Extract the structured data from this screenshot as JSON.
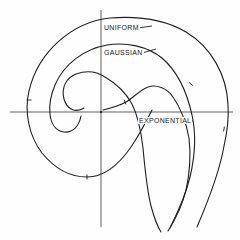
{
  "figure": {
    "title_hint": "spiral phasor diagram",
    "background": "#fefefe",
    "ink": "#1f1f1f",
    "axis_color": "#3a3a3a",
    "axes": {
      "horizontal": {
        "x1": 10,
        "y1": 112,
        "x2": 233,
        "y2": 112
      },
      "vertical": {
        "x1": 101,
        "y1": 10,
        "x2": 101,
        "y2": 227
      },
      "center_mark": {
        "x": 101,
        "y": 112
      }
    },
    "labels": [
      {
        "id": "uniform",
        "text": "UNIFORM",
        "left": 103,
        "top": 24,
        "leader": {
          "x1": 138,
          "y1": 28,
          "x2": 152,
          "y2": 26
        }
      },
      {
        "id": "gaussian",
        "text": "GAUSSIAN",
        "left": 103,
        "top": 49,
        "leader": {
          "x1": 142,
          "y1": 53,
          "x2": 156,
          "y2": 49
        }
      },
      {
        "id": "exponential",
        "text": "EXPONENTIAL",
        "left": 138,
        "top": 117,
        "leader": {
          "x1": 184,
          "y1": 121,
          "x2": 193,
          "y2": 121
        }
      }
    ],
    "curves": [
      {
        "name": "uniform",
        "d": "M 197,227 C 209,199 220,170 224,146 C 227,133 229,119 228,105 C 227,75 211,47 186,32 C 164,19 136,16 110,18 C 72,22 38,52 29,91 C 24,112 29,136 42,153 C 55,169 70,177 87,177 C 105,177 120,163 131,147 C 138,137 146,122 152,110"
      },
      {
        "name": "gaussian",
        "d": "M 170,228 C 178,212 186,194 190,177 C 195,156 196,133 192,115 C 187,92 177,71 162,58 C 147,46 126,42 107,45 C 84,49 64,64 55,85 C 50,97 49,106 50,114 C 51,124 56,131 64,132 C 73,133 79,126 81,116"
      },
      {
        "name": "inner-curl",
        "d": "M 84,108 C 76,113 67,110 64,99 C 61,88 66,78 76,74 C 87,70 96,71 105,77 C 117,84 126,93 132,104 C 138,116 141,131 143,148 C 145,170 147,190 151,206 C 154,217 157,226 161,232"
      },
      {
        "name": "exponential",
        "d": "M 103,110 C 111,108 119,106 126,102 C 133,98 140,90 148,87 C 156,84 167,88 173,97 C 180,107 186,122 189,138 C 191,155 190,172 186,190 C 182,207 175,220 168,231"
      }
    ],
    "ticks": [
      {
        "x": 125,
        "y": 102,
        "angle": 70,
        "len": 5
      },
      {
        "x": 224,
        "y": 129,
        "angle": 100,
        "len": 5
      },
      {
        "x": 191,
        "y": 84,
        "angle": 40,
        "len": 5
      },
      {
        "x": 87,
        "y": 177,
        "angle": 90,
        "len": 5
      },
      {
        "x": 29,
        "y": 100,
        "angle": 0,
        "len": 5
      }
    ]
  }
}
